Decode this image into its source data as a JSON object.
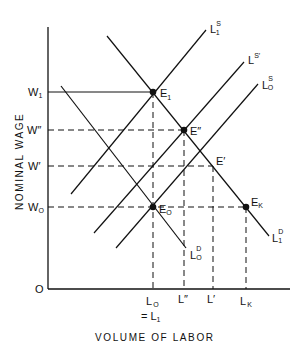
{
  "axes": {
    "y_title": "NOMINAL WAGE",
    "x_title": "VOLUME OF LABOR",
    "origin": "O"
  },
  "y_ticks": [
    {
      "id": "w1",
      "main": "W",
      "sub": "1",
      "y": 92
    },
    {
      "id": "wpp",
      "main": "W″",
      "sub": "",
      "y": 130
    },
    {
      "id": "wp",
      "main": "W′",
      "sub": "",
      "y": 166
    },
    {
      "id": "w0",
      "main": "W",
      "sub": "O",
      "y": 207
    }
  ],
  "x_ticks": [
    {
      "id": "l0",
      "main": "L",
      "sub": "O",
      "x": 153,
      "extra": "= L",
      "extra_sub": "1"
    },
    {
      "id": "lpp",
      "main": "L″",
      "sub": "",
      "x": 184
    },
    {
      "id": "lp",
      "main": "L′",
      "sub": "",
      "x": 213
    },
    {
      "id": "lk",
      "main": "L",
      "sub": "K",
      "x": 246
    }
  ],
  "curves": [
    {
      "id": "l1s",
      "label": "L",
      "sup": "S",
      "sub": "1",
      "kind": "supply"
    },
    {
      "id": "lsp",
      "label": "L",
      "sup": "S′",
      "sub": "",
      "kind": "supply"
    },
    {
      "id": "l0s",
      "label": "L",
      "sup": "S",
      "sub": "O",
      "kind": "supply"
    },
    {
      "id": "l1d",
      "label": "L",
      "sup": "D",
      "sub": "1",
      "kind": "demand"
    },
    {
      "id": "l0d",
      "label": "L",
      "sup": "D",
      "sub": "O",
      "kind": "demand"
    }
  ],
  "points": [
    {
      "id": "e1",
      "label": "E",
      "sub": "1",
      "dot": true
    },
    {
      "id": "epp",
      "label": "E″",
      "sub": "",
      "dot": true
    },
    {
      "id": "ep",
      "label": "E′",
      "sub": "",
      "dot": false
    },
    {
      "id": "e0",
      "label": "E",
      "sub": "O",
      "dot": true
    },
    {
      "id": "ek",
      "label": "E",
      "sub": "K",
      "dot": true
    }
  ],
  "colors": {
    "ink": "#111111",
    "background": "#ffffff"
  }
}
